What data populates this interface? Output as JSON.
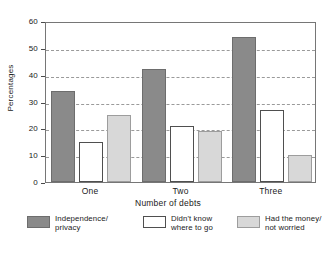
{
  "chart_data": {
    "type": "bar",
    "title": "",
    "xlabel": "Number of debts",
    "ylabel": "Percentages",
    "categories": [
      "One",
      "Two",
      "Three"
    ],
    "series": [
      {
        "name": "Independence/\nprivacy",
        "values": [
          34,
          42,
          54
        ],
        "color": "#8a8a8a"
      },
      {
        "name": "Didn't know\nwhere to go",
        "values": [
          15,
          21,
          27
        ],
        "color": "#ffffff"
      },
      {
        "name": "Had the money/\nnot worried",
        "values": [
          25,
          19,
          10
        ],
        "color": "#d8d8d8"
      }
    ],
    "ylim": [
      0,
      60
    ],
    "yticks": [
      0,
      10,
      20,
      30,
      40,
      50,
      60
    ],
    "ytick_labels": [
      "0",
      "10",
      "20",
      "30",
      "40",
      "50",
      "60"
    ],
    "grid": true,
    "grid_axis": "y",
    "grid_style": "dashed",
    "legend_position": "bottom"
  },
  "legend": {
    "entries": [
      {
        "label": "Independence/\nprivacy",
        "swatch": "dark-gray-swatch"
      },
      {
        "label": "Didn't know\nwhere to go",
        "swatch": "white-swatch"
      },
      {
        "label": "Had the money/\nnot worried",
        "swatch": "light-gray-swatch"
      }
    ]
  },
  "colors": {
    "series_1": "#8a8a8a",
    "series_2": "#ffffff",
    "series_3": "#d8d8d8",
    "gridline": "#9a9a9a",
    "frame": "#767676",
    "text": "#1a1a1a",
    "background": "#ffffff"
  }
}
